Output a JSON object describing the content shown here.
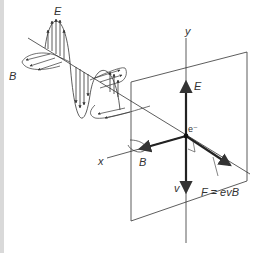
{
  "figure": {
    "labels": {
      "wave_E": "E",
      "wave_B": "B",
      "axis_y": "y",
      "axis_x": "x",
      "field_E": "E",
      "field_B": "B",
      "electron": "e⁻",
      "velocity": "v",
      "force": "F = evB"
    },
    "colors": {
      "line": "#333333",
      "strip": "#d9d9d9",
      "background": "#ffffff"
    }
  }
}
